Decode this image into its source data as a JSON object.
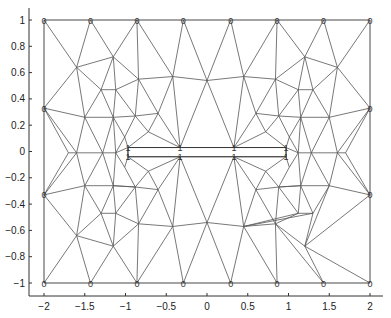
{
  "chart_data": {
    "type": "mesh",
    "title": "",
    "xlabel": "",
    "ylabel": "",
    "xlim": [
      -2.2,
      2.1
    ],
    "ylim": [
      -1.1,
      1.1
    ],
    "grid": false,
    "xticks": [
      -2,
      -1.5,
      -1,
      -0.5,
      0,
      0.5,
      1,
      1.5,
      2
    ],
    "xtick_labels": [
      "−2",
      "−1.5",
      "−1",
      "−0.5",
      "0",
      "0.5",
      "1",
      "1.5",
      "2"
    ],
    "yticks": [
      1,
      0.8,
      0.6,
      0.4,
      0.2,
      0,
      -0.2,
      -0.4,
      -0.6,
      -0.8,
      -1
    ],
    "ytick_labels": [
      "1",
      "0.8",
      "0.6",
      "0.4",
      "0.2",
      "0",
      "−0.2",
      "−0.4",
      "−0.6",
      "−0.8",
      "−1"
    ],
    "outer_boundary": [
      [
        -2,
        -1
      ],
      [
        2,
        -1
      ],
      [
        2,
        1
      ],
      [
        -2,
        1
      ]
    ],
    "slot_boundary": {
      "x": [
        -0.97,
        0.97
      ],
      "y": [
        0.03,
        -0.04
      ]
    },
    "boundary_labels": [
      {
        "x": -2,
        "y": 1,
        "label": "0"
      },
      {
        "x": -1.43,
        "y": 1,
        "label": "0"
      },
      {
        "x": -0.86,
        "y": 1,
        "label": "0"
      },
      {
        "x": -0.29,
        "y": 1,
        "label": "0"
      },
      {
        "x": 0.29,
        "y": 1,
        "label": "0"
      },
      {
        "x": 0.86,
        "y": 1,
        "label": "0"
      },
      {
        "x": 1.43,
        "y": 1,
        "label": "0"
      },
      {
        "x": 2,
        "y": 1,
        "label": "0"
      },
      {
        "x": -2,
        "y": -1,
        "label": "0"
      },
      {
        "x": -1.43,
        "y": -1,
        "label": "0"
      },
      {
        "x": -0.86,
        "y": -1,
        "label": "0"
      },
      {
        "x": -0.29,
        "y": -1,
        "label": "0"
      },
      {
        "x": 0.29,
        "y": -1,
        "label": "0"
      },
      {
        "x": 0.86,
        "y": -1,
        "label": "0"
      },
      {
        "x": 1.43,
        "y": -1,
        "label": "0"
      },
      {
        "x": 2,
        "y": -1,
        "label": "0"
      },
      {
        "x": -2,
        "y": 0.33,
        "label": "0"
      },
      {
        "x": -2,
        "y": -0.33,
        "label": "0"
      },
      {
        "x": 2,
        "y": 0.33,
        "label": "0"
      },
      {
        "x": 2,
        "y": -0.33,
        "label": "0"
      },
      {
        "x": -0.97,
        "y": 0.03,
        "label": "1"
      },
      {
        "x": -0.33,
        "y": 0.03,
        "label": "1"
      },
      {
        "x": 0.33,
        "y": 0.03,
        "label": "1"
      },
      {
        "x": 0.97,
        "y": 0.03,
        "label": "1"
      },
      {
        "x": -0.97,
        "y": -0.04,
        "label": "1"
      },
      {
        "x": -0.33,
        "y": -0.04,
        "label": "1"
      },
      {
        "x": 0.33,
        "y": -0.04,
        "label": "1"
      },
      {
        "x": 0.97,
        "y": -0.04,
        "label": "1"
      }
    ],
    "nodes": [
      [
        -2,
        1
      ],
      [
        -1.43,
        1
      ],
      [
        -0.86,
        1
      ],
      [
        -0.29,
        1
      ],
      [
        0.29,
        1
      ],
      [
        0.86,
        1
      ],
      [
        1.43,
        1
      ],
      [
        2,
        1
      ],
      [
        -2,
        0.33
      ],
      [
        2,
        0.33
      ],
      [
        -2,
        -0.33
      ],
      [
        2,
        -0.33
      ],
      [
        -2,
        -1
      ],
      [
        -1.43,
        -1
      ],
      [
        -0.86,
        -1
      ],
      [
        -0.29,
        -1
      ],
      [
        0.29,
        -1
      ],
      [
        0.86,
        -1
      ],
      [
        1.43,
        -1
      ],
      [
        2,
        -1
      ],
      [
        -1.6,
        0.64
      ],
      [
        -1.15,
        0.72
      ],
      [
        -0.84,
        0.55
      ],
      [
        -0.42,
        0.57
      ],
      [
        0,
        0.54
      ],
      [
        0.45,
        0.57
      ],
      [
        0.84,
        0.55
      ],
      [
        1.2,
        0.72
      ],
      [
        1.6,
        0.64
      ],
      [
        -1.3,
        0.47
      ],
      [
        -1.12,
        0.47
      ],
      [
        1.12,
        0.47
      ],
      [
        1.3,
        0.47
      ],
      [
        -1.5,
        0.26
      ],
      [
        -1.15,
        0.26
      ],
      [
        -0.88,
        0.27
      ],
      [
        -0.6,
        0.29
      ],
      [
        0.6,
        0.29
      ],
      [
        0.88,
        0.27
      ],
      [
        1.15,
        0.26
      ],
      [
        1.5,
        0.26
      ],
      [
        -0.72,
        0.15
      ],
      [
        0.72,
        0.15
      ],
      [
        -1.01,
        0.11
      ],
      [
        1.01,
        0.11
      ],
      [
        -0.97,
        0.03
      ],
      [
        -0.33,
        0.03
      ],
      [
        0.33,
        0.03
      ],
      [
        0.97,
        0.03
      ],
      [
        -0.97,
        -0.04
      ],
      [
        -0.33,
        -0.04
      ],
      [
        0.33,
        -0.04
      ],
      [
        0.97,
        -0.04
      ],
      [
        -1.7,
        -0.01
      ],
      [
        -1.6,
        -0.01
      ],
      [
        -1.28,
        -0.01
      ],
      [
        -1.12,
        -0.01
      ],
      [
        1.12,
        -0.01
      ],
      [
        1.28,
        -0.01
      ],
      [
        1.6,
        -0.01
      ],
      [
        1.7,
        -0.01
      ],
      [
        -1.01,
        -0.12
      ],
      [
        1.01,
        -0.12
      ],
      [
        -0.72,
        -0.15
      ],
      [
        0.72,
        -0.15
      ],
      [
        -1.5,
        -0.26
      ],
      [
        -1.15,
        -0.26
      ],
      [
        -0.88,
        -0.27
      ],
      [
        -0.6,
        -0.29
      ],
      [
        0.6,
        -0.29
      ],
      [
        0.88,
        -0.27
      ],
      [
        1.15,
        -0.26
      ],
      [
        1.5,
        -0.26
      ],
      [
        -1.3,
        -0.47
      ],
      [
        -1.12,
        -0.47
      ],
      [
        1.12,
        -0.47
      ],
      [
        1.3,
        -0.47
      ],
      [
        -1.6,
        -0.64
      ],
      [
        -1.15,
        -0.72
      ],
      [
        -0.84,
        -0.55
      ],
      [
        -0.42,
        -0.57
      ],
      [
        0,
        -0.54
      ],
      [
        0.45,
        -0.57
      ],
      [
        0.84,
        -0.55
      ],
      [
        1.2,
        -0.72
      ],
      [
        1.6,
        -0.64
      ]
    ],
    "edges": [
      [
        0,
        20
      ],
      [
        1,
        20
      ],
      [
        1,
        21
      ],
      [
        2,
        21
      ],
      [
        2,
        22
      ],
      [
        2,
        23
      ],
      [
        3,
        23
      ],
      [
        3,
        24
      ],
      [
        4,
        24
      ],
      [
        4,
        25
      ],
      [
        5,
        25
      ],
      [
        5,
        26
      ],
      [
        5,
        27
      ],
      [
        6,
        27
      ],
      [
        6,
        28
      ],
      [
        7,
        28
      ],
      [
        8,
        20
      ],
      [
        8,
        33
      ],
      [
        9,
        28
      ],
      [
        9,
        40
      ],
      [
        20,
        21
      ],
      [
        21,
        22
      ],
      [
        22,
        23
      ],
      [
        23,
        24
      ],
      [
        24,
        25
      ],
      [
        25,
        26
      ],
      [
        26,
        27
      ],
      [
        27,
        28
      ],
      [
        20,
        29
      ],
      [
        20,
        33
      ],
      [
        21,
        29
      ],
      [
        21,
        30
      ],
      [
        22,
        30
      ],
      [
        22,
        35
      ],
      [
        22,
        36
      ],
      [
        23,
        36
      ],
      [
        23,
        46
      ],
      [
        24,
        46
      ],
      [
        24,
        47
      ],
      [
        25,
        47
      ],
      [
        25,
        37
      ],
      [
        26,
        37
      ],
      [
        26,
        31
      ],
      [
        26,
        38
      ],
      [
        27,
        31
      ],
      [
        27,
        32
      ],
      [
        28,
        32
      ],
      [
        28,
        40
      ],
      [
        29,
        30
      ],
      [
        31,
        32
      ],
      [
        29,
        33
      ],
      [
        29,
        34
      ],
      [
        30,
        34
      ],
      [
        30,
        35
      ],
      [
        31,
        38
      ],
      [
        31,
        39
      ],
      [
        32,
        39
      ],
      [
        32,
        40
      ],
      [
        33,
        34
      ],
      [
        34,
        35
      ],
      [
        35,
        36
      ],
      [
        37,
        38
      ],
      [
        38,
        39
      ],
      [
        39,
        40
      ],
      [
        36,
        41
      ],
      [
        36,
        46
      ],
      [
        35,
        41
      ],
      [
        35,
        43
      ],
      [
        34,
        43
      ],
      [
        37,
        42
      ],
      [
        37,
        47
      ],
      [
        38,
        42
      ],
      [
        38,
        44
      ],
      [
        39,
        44
      ],
      [
        41,
        46
      ],
      [
        41,
        45
      ],
      [
        42,
        47
      ],
      [
        42,
        48
      ],
      [
        43,
        45
      ],
      [
        44,
        48
      ],
      [
        45,
        46
      ],
      [
        46,
        47
      ],
      [
        47,
        48
      ],
      [
        49,
        50
      ],
      [
        50,
        51
      ],
      [
        51,
        52
      ],
      [
        45,
        49
      ],
      [
        48,
        52
      ],
      [
        8,
        53
      ],
      [
        8,
        54
      ],
      [
        33,
        54
      ],
      [
        33,
        55
      ],
      [
        34,
        55
      ],
      [
        34,
        56
      ],
      [
        43,
        56
      ],
      [
        39,
        57
      ],
      [
        44,
        57
      ],
      [
        39,
        58
      ],
      [
        40,
        58
      ],
      [
        40,
        59
      ],
      [
        9,
        59
      ],
      [
        9,
        60
      ],
      [
        53,
        54
      ],
      [
        54,
        55
      ],
      [
        55,
        56
      ],
      [
        56,
        45
      ],
      [
        57,
        48
      ],
      [
        57,
        58
      ],
      [
        58,
        59
      ],
      [
        59,
        60
      ],
      [
        10,
        53
      ],
      [
        10,
        54
      ],
      [
        11,
        59
      ],
      [
        11,
        60
      ],
      [
        10,
        65
      ],
      [
        10,
        77
      ],
      [
        11,
        72
      ],
      [
        11,
        84
      ],
      [
        54,
        65
      ],
      [
        55,
        65
      ],
      [
        55,
        66
      ],
      [
        56,
        66
      ],
      [
        56,
        61
      ],
      [
        61,
        49
      ],
      [
        61,
        67
      ],
      [
        66,
        67
      ],
      [
        58,
        71
      ],
      [
        58,
        72
      ],
      [
        59,
        72
      ],
      [
        57,
        71
      ],
      [
        57,
        62
      ],
      [
        62,
        52
      ],
      [
        62,
        70
      ],
      [
        71,
        70
      ],
      [
        49,
        63
      ],
      [
        63,
        50
      ],
      [
        63,
        67
      ],
      [
        63,
        68
      ],
      [
        68,
        50
      ],
      [
        52,
        64
      ],
      [
        64,
        51
      ],
      [
        64,
        70
      ],
      [
        64,
        69
      ],
      [
        69,
        51
      ],
      [
        65,
        66
      ],
      [
        66,
        67
      ],
      [
        67,
        68
      ],
      [
        69,
        70
      ],
      [
        70,
        71
      ],
      [
        71,
        72
      ],
      [
        65,
        73
      ],
      [
        65,
        77
      ],
      [
        66,
        73
      ],
      [
        66,
        74
      ],
      [
        67,
        74
      ],
      [
        67,
        79
      ],
      [
        68,
        79
      ],
      [
        68,
        80
      ],
      [
        50,
        80
      ],
      [
        50,
        81
      ],
      [
        51,
        81
      ],
      [
        51,
        82
      ],
      [
        69,
        82
      ],
      [
        69,
        83
      ],
      [
        70,
        83
      ],
      [
        70,
        75
      ],
      [
        71,
        75
      ],
      [
        71,
        76
      ],
      [
        72,
        76
      ],
      [
        72,
        84
      ],
      [
        73,
        74
      ],
      [
        75,
        76
      ],
      [
        73,
        77
      ],
      [
        73,
        78
      ],
      [
        74,
        78
      ],
      [
        74,
        79
      ],
      [
        75,
        83
      ],
      [
        75,
        82
      ],
      [
        76,
        82
      ],
      [
        76,
        84
      ],
      [
        77,
        78
      ],
      [
        78,
        79
      ],
      [
        79,
        80
      ],
      [
        80,
        81
      ],
      [
        81,
        82
      ],
      [
        82,
        83
      ],
      [
        83,
        84
      ],
      [
        12,
        77
      ],
      [
        13,
        77
      ],
      [
        13,
        78
      ],
      [
        14,
        78
      ],
      [
        14,
        79
      ],
      [
        14,
        80
      ],
      [
        15,
        80
      ],
      [
        15,
        81
      ],
      [
        16,
        81
      ],
      [
        16,
        82
      ],
      [
        17,
        82
      ],
      [
        17,
        83
      ],
      [
        18,
        83
      ],
      [
        18,
        84
      ],
      [
        19,
        84
      ]
    ]
  }
}
